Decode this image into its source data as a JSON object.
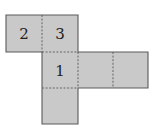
{
  "diagram": {
    "type": "cube-net",
    "cell_size": 36,
    "fill_color": "#c9c9c9",
    "line_color": "#5a5a5a",
    "faces": [
      {
        "id": "face-2",
        "label": "2",
        "col": 0,
        "row": 0
      },
      {
        "id": "face-3",
        "label": "3",
        "col": 1,
        "row": 0
      },
      {
        "id": "face-1",
        "label": "1",
        "col": 1,
        "row": 1
      },
      {
        "id": "face-right-a",
        "label": "",
        "col": 2,
        "row": 1
      },
      {
        "id": "face-right-b",
        "label": "",
        "col": 3,
        "row": 1
      },
      {
        "id": "face-bottom",
        "label": "",
        "col": 1,
        "row": 2
      }
    ]
  }
}
